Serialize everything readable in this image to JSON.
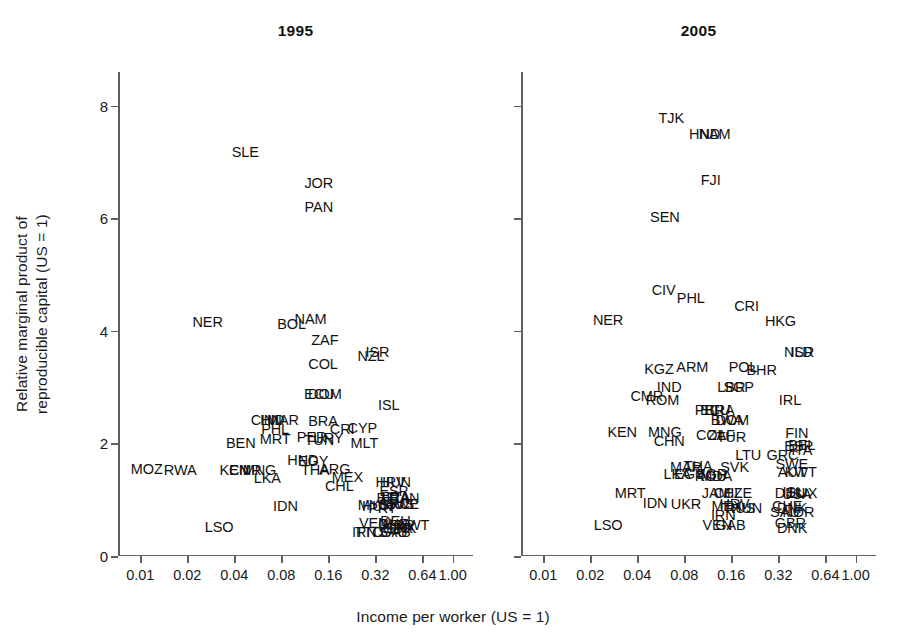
{
  "figure": {
    "xlabel": "Income per worker (US = 1)",
    "ylabel": "Relative marginal product of\nreproducible capital (US = 1)"
  },
  "axes": {
    "xticklabels": [
      "0.01",
      "0.02",
      "0.04",
      "0.08",
      "0.16",
      "0.32",
      "0.64",
      "1.00"
    ],
    "yticklabels": [
      "0",
      "2",
      "4",
      "6",
      "8"
    ]
  },
  "panels": [
    {
      "title": "1995"
    },
    {
      "title": "2005"
    }
  ],
  "chart_data": {
    "type": "scatter",
    "xlabel": "Income per worker (US = 1)",
    "ylabel": "Relative marginal product of reproducible capital (US = 1)",
    "xscale": "log2",
    "xticks": [
      0.01,
      0.02,
      0.04,
      0.08,
      0.16,
      0.32,
      0.64,
      1.0
    ],
    "xticklabels": [
      "0.01",
      "0.02",
      "0.04",
      "0.08",
      "0.16",
      "0.32",
      "0.64",
      "1.00"
    ],
    "xlim": [
      0.0072,
      1.35
    ],
    "yticks": [
      0,
      2,
      4,
      6,
      8
    ],
    "ylim": [
      0,
      8.6
    ],
    "grid": false,
    "legend": null,
    "marker_style": "text-label (ISO-3 country code used as the point marker; no symbols drawn)",
    "panels": [
      {
        "name": "1995",
        "points": [
          {
            "label": "SLE",
            "x": 0.047,
            "y": 7.18
          },
          {
            "label": "JOR",
            "x": 0.139,
            "y": 6.62
          },
          {
            "label": "PAN",
            "x": 0.139,
            "y": 6.2
          },
          {
            "label": "NER",
            "x": 0.027,
            "y": 4.16
          },
          {
            "label": "BOL",
            "x": 0.093,
            "y": 4.13
          },
          {
            "label": "NAM",
            "x": 0.123,
            "y": 4.22
          },
          {
            "label": "ZAF",
            "x": 0.152,
            "y": 3.83
          },
          {
            "label": "NZL",
            "x": 0.3,
            "y": 3.55
          },
          {
            "label": "ISR",
            "x": 0.33,
            "y": 3.62
          },
          {
            "label": "COL",
            "x": 0.148,
            "y": 3.41
          },
          {
            "label": "ECU",
            "x": 0.14,
            "y": 2.88
          },
          {
            "label": "DOM",
            "x": 0.152,
            "y": 2.88
          },
          {
            "label": "ISL",
            "x": 0.39,
            "y": 2.68
          },
          {
            "label": "CHN",
            "x": 0.064,
            "y": 2.42
          },
          {
            "label": "IND",
            "x": 0.07,
            "y": 2.42
          },
          {
            "label": "MAR",
            "x": 0.082,
            "y": 2.42
          },
          {
            "label": "BRA",
            "x": 0.148,
            "y": 2.4
          },
          {
            "label": "CRI",
            "x": 0.196,
            "y": 2.26
          },
          {
            "label": "CYP",
            "x": 0.264,
            "y": 2.27
          },
          {
            "label": "PHL",
            "x": 0.073,
            "y": 2.25
          },
          {
            "label": "PER",
            "x": 0.125,
            "y": 2.12
          },
          {
            "label": "TUN",
            "x": 0.14,
            "y": 2.07
          },
          {
            "label": "URY",
            "x": 0.16,
            "y": 2.1
          },
          {
            "label": "MRT",
            "x": 0.073,
            "y": 2.08
          },
          {
            "label": "MLT",
            "x": 0.272,
            "y": 2.0
          },
          {
            "label": "BEN",
            "x": 0.044,
            "y": 2.0
          },
          {
            "label": "HND",
            "x": 0.11,
            "y": 1.7
          },
          {
            "label": "EGY",
            "x": 0.128,
            "y": 1.68
          },
          {
            "label": "MOZ",
            "x": 0.011,
            "y": 1.54
          },
          {
            "label": "RWA",
            "x": 0.018,
            "y": 1.52
          },
          {
            "label": "KEN",
            "x": 0.04,
            "y": 1.53
          },
          {
            "label": "CMR",
            "x": 0.047,
            "y": 1.53
          },
          {
            "label": "MNG",
            "x": 0.058,
            "y": 1.53
          },
          {
            "label": "THA",
            "x": 0.132,
            "y": 1.52
          },
          {
            "label": "ARG",
            "x": 0.176,
            "y": 1.55
          },
          {
            "label": "LKA",
            "x": 0.065,
            "y": 1.38
          },
          {
            "label": "MEX",
            "x": 0.212,
            "y": 1.4
          },
          {
            "label": "CHL",
            "x": 0.188,
            "y": 1.24
          },
          {
            "label": "HRV",
            "x": 0.4,
            "y": 1.32
          },
          {
            "label": "HUN",
            "x": 0.43,
            "y": 1.32
          },
          {
            "label": "ESP",
            "x": 0.42,
            "y": 1.16
          },
          {
            "label": "BEL",
            "x": 0.398,
            "y": 1.03
          },
          {
            "label": "FRA",
            "x": 0.43,
            "y": 1.04
          },
          {
            "label": "ITA",
            "x": 0.455,
            "y": 1.04
          },
          {
            "label": "CAN",
            "x": 0.49,
            "y": 1.03
          },
          {
            "label": "GRC",
            "x": 0.42,
            "y": 0.92
          },
          {
            "label": "AUS",
            "x": 0.455,
            "y": 0.92
          },
          {
            "label": "SWE",
            "x": 0.478,
            "y": 0.92
          },
          {
            "label": "MYS",
            "x": 0.31,
            "y": 0.9
          },
          {
            "label": "HUN2",
            "x": 0.33,
            "y": 0.88
          },
          {
            "label": "PRT",
            "x": 0.355,
            "y": 0.86
          },
          {
            "label": "IDN",
            "x": 0.085,
            "y": 0.88
          },
          {
            "label": "VEN",
            "x": 0.312,
            "y": 0.58
          },
          {
            "label": "DEU",
            "x": 0.43,
            "y": 0.62
          },
          {
            "label": "CHE",
            "x": 0.418,
            "y": 0.56
          },
          {
            "label": "NOR",
            "x": 0.452,
            "y": 0.55
          },
          {
            "label": "GBR",
            "x": 0.445,
            "y": 0.5
          },
          {
            "label": "DNK",
            "x": 0.468,
            "y": 0.5
          },
          {
            "label": "KWT",
            "x": 0.56,
            "y": 0.55
          },
          {
            "label": "IRN",
            "x": 0.272,
            "y": 0.42
          },
          {
            "label": "TTO",
            "x": 0.292,
            "y": 0.42
          },
          {
            "label": "GAB",
            "x": 0.43,
            "y": 0.42
          },
          {
            "label": "SAU",
            "x": 0.415,
            "y": 0.43
          },
          {
            "label": "LSO",
            "x": 0.032,
            "y": 0.52
          }
        ]
      },
      {
        "name": "2005",
        "points": [
          {
            "label": "TJK",
            "x": 0.066,
            "y": 7.78
          },
          {
            "label": "HND",
            "x": 0.108,
            "y": 7.5
          },
          {
            "label": "NAM",
            "x": 0.125,
            "y": 7.5
          },
          {
            "label": "FJI",
            "x": 0.118,
            "y": 6.68
          },
          {
            "label": "SEN",
            "x": 0.06,
            "y": 6.02
          },
          {
            "label": "CIV",
            "x": 0.059,
            "y": 4.72
          },
          {
            "label": "PHL",
            "x": 0.088,
            "y": 4.58
          },
          {
            "label": "CRI",
            "x": 0.2,
            "y": 4.44
          },
          {
            "label": "NER",
            "x": 0.026,
            "y": 4.2
          },
          {
            "label": "HKG",
            "x": 0.33,
            "y": 4.18
          },
          {
            "label": "NLD",
            "x": 0.43,
            "y": 3.62
          },
          {
            "label": "ISR",
            "x": 0.455,
            "y": 3.62
          },
          {
            "label": "KGZ",
            "x": 0.055,
            "y": 3.32
          },
          {
            "label": "ARM",
            "x": 0.09,
            "y": 3.35
          },
          {
            "label": "POL",
            "x": 0.19,
            "y": 3.35
          },
          {
            "label": "BHR",
            "x": 0.25,
            "y": 3.3
          },
          {
            "label": "IND",
            "x": 0.064,
            "y": 3.0
          },
          {
            "label": "LBR",
            "x": 0.16,
            "y": 3.0
          },
          {
            "label": "SGP",
            "x": 0.178,
            "y": 3.0
          },
          {
            "label": "CMR",
            "x": 0.046,
            "y": 2.85
          },
          {
            "label": "ROM",
            "x": 0.058,
            "y": 2.78
          },
          {
            "label": "IRL",
            "x": 0.38,
            "y": 2.78
          },
          {
            "label": "PER",
            "x": 0.116,
            "y": 2.6
          },
          {
            "label": "BRA",
            "x": 0.135,
            "y": 2.6
          },
          {
            "label": "ECU",
            "x": 0.126,
            "y": 2.6
          },
          {
            "label": "BWA",
            "x": 0.15,
            "y": 2.42
          },
          {
            "label": "DOM",
            "x": 0.162,
            "y": 2.42
          },
          {
            "label": "KEN",
            "x": 0.032,
            "y": 2.2
          },
          {
            "label": "MNG",
            "x": 0.06,
            "y": 2.2
          },
          {
            "label": "COL",
            "x": 0.118,
            "y": 2.15
          },
          {
            "label": "ZAF",
            "x": 0.138,
            "y": 2.15
          },
          {
            "label": "TUR",
            "x": 0.16,
            "y": 2.12
          },
          {
            "label": "CHN",
            "x": 0.064,
            "y": 2.05
          },
          {
            "label": "FIN",
            "x": 0.42,
            "y": 2.18
          },
          {
            "label": "ESP",
            "x": 0.432,
            "y": 1.96
          },
          {
            "label": "BEL",
            "x": 0.452,
            "y": 1.98
          },
          {
            "label": "ITA",
            "x": 0.452,
            "y": 1.88
          },
          {
            "label": "LTU",
            "x": 0.205,
            "y": 1.8
          },
          {
            "label": "GRC",
            "x": 0.34,
            "y": 1.8
          },
          {
            "label": "SWE",
            "x": 0.39,
            "y": 1.64
          },
          {
            "label": "MAR",
            "x": 0.082,
            "y": 1.58
          },
          {
            "label": "THA",
            "x": 0.098,
            "y": 1.6
          },
          {
            "label": "SVK",
            "x": 0.168,
            "y": 1.58
          },
          {
            "label": "AUT",
            "x": 0.392,
            "y": 1.5
          },
          {
            "label": "KWT",
            "x": 0.445,
            "y": 1.5
          },
          {
            "label": "LKA",
            "x": 0.072,
            "y": 1.45
          },
          {
            "label": "EGY",
            "x": 0.086,
            "y": 1.45
          },
          {
            "label": "ROU",
            "x": 0.118,
            "y": 1.42
          },
          {
            "label": "MDA",
            "x": 0.128,
            "y": 1.42
          },
          {
            "label": "BGR",
            "x": 0.12,
            "y": 1.45
          },
          {
            "label": "MRT",
            "x": 0.036,
            "y": 1.12
          },
          {
            "label": "JAM",
            "x": 0.128,
            "y": 1.12
          },
          {
            "label": "CHL",
            "x": 0.152,
            "y": 1.12
          },
          {
            "label": "CZE",
            "x": 0.176,
            "y": 1.12
          },
          {
            "label": "DEU",
            "x": 0.38,
            "y": 1.12
          },
          {
            "label": "USA",
            "x": 0.42,
            "y": 1.1
          },
          {
            "label": "ISL",
            "x": 0.398,
            "y": 1.14
          },
          {
            "label": "LUX",
            "x": 0.462,
            "y": 1.12
          },
          {
            "label": "IDN",
            "x": 0.052,
            "y": 0.95
          },
          {
            "label": "UKR",
            "x": 0.082,
            "y": 0.92
          },
          {
            "label": "MEX",
            "x": 0.15,
            "y": 0.88
          },
          {
            "label": "HRV",
            "x": 0.168,
            "y": 0.92
          },
          {
            "label": "RUS",
            "x": 0.182,
            "y": 0.86
          },
          {
            "label": "HUN",
            "x": 0.2,
            "y": 0.86
          },
          {
            "label": "CHE",
            "x": 0.365,
            "y": 0.88
          },
          {
            "label": "DNK",
            "x": 0.392,
            "y": 0.86
          },
          {
            "label": "NOR",
            "x": 0.43,
            "y": 0.78
          },
          {
            "label": "SAU",
            "x": 0.352,
            "y": 0.78
          },
          {
            "label": "IRN",
            "x": 0.142,
            "y": 0.72
          },
          {
            "label": "VEN",
            "x": 0.13,
            "y": 0.55
          },
          {
            "label": "GAB",
            "x": 0.158,
            "y": 0.55
          },
          {
            "label": "GBR",
            "x": 0.382,
            "y": 0.58
          },
          {
            "label": "DNK2",
            "x": 0.392,
            "y": 0.5
          },
          {
            "label": "LSO",
            "x": 0.026,
            "y": 0.55
          }
        ]
      }
    ]
  }
}
